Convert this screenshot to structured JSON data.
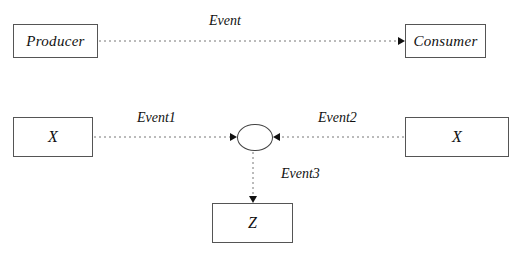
{
  "diagram": {
    "title_text": "",
    "background_color": "#ffffff",
    "stroke_color": "#555555",
    "edge_color": "#777777",
    "text_color": "#111111",
    "nodes": [
      {
        "id": "producer",
        "label": "Producer",
        "shape": "rectangle",
        "x": 13,
        "y": 24,
        "w": 85,
        "h": 34
      },
      {
        "id": "consumer",
        "label": "Consumer",
        "shape": "rectangle",
        "x": 405,
        "y": 24,
        "w": 81,
        "h": 34
      },
      {
        "id": "x-left",
        "label": "X",
        "shape": "rectangle",
        "x": 13,
        "y": 117,
        "w": 80,
        "h": 40
      },
      {
        "id": "x-right",
        "label": "X",
        "shape": "rectangle",
        "x": 405,
        "y": 117,
        "w": 104,
        "h": 40
      },
      {
        "id": "z",
        "label": "Z",
        "shape": "rectangle",
        "x": 212,
        "y": 203,
        "w": 81,
        "h": 40
      },
      {
        "id": "junction",
        "label": "",
        "shape": "stadium",
        "x": 237,
        "y": 124,
        "w": 36,
        "h": 27
      }
    ],
    "edges": [
      {
        "id": "edge-event",
        "label": "Event",
        "from": "producer",
        "to": "consumer",
        "style": "dashed",
        "arrow": "right",
        "label_x": 209,
        "label_y": 14
      },
      {
        "id": "edge-event1",
        "label": "Event1",
        "from": "x-left",
        "to": "junction",
        "style": "dashed",
        "arrow": "right",
        "label_x": 137,
        "label_y": 111
      },
      {
        "id": "edge-event2",
        "label": "Event2",
        "from": "x-right",
        "to": "junction",
        "style": "dashed",
        "arrow": "left",
        "label_x": 318,
        "label_y": 111
      },
      {
        "id": "edge-event3",
        "label": "Event3",
        "from": "junction",
        "to": "z",
        "style": "dashed",
        "arrow": "down",
        "label_x": 281,
        "label_y": 167
      }
    ]
  }
}
